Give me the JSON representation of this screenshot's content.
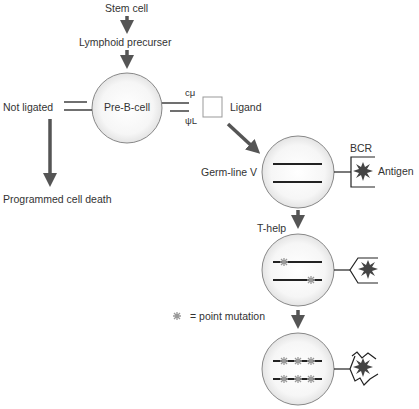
{
  "labels": {
    "stem_cell": "Stem cell",
    "lymphoid_precursor": "Lymphoid precurser",
    "pre_b_cell": "Pre-B-cell",
    "not_ligated": "Not ligated",
    "programmed_cell_death": "Programmed cell death",
    "c_mu": "cμ",
    "psi_l": "ψL",
    "ligand": "Ligand",
    "germ_line_v": "Germ-line V",
    "bcr": "BCR",
    "antigen": "Antigen",
    "t_help": "T-help",
    "legend_symbol": "✻",
    "legend_text": "= point mutation"
  },
  "colors": {
    "arrow": "#555555",
    "line": "#222222",
    "cell_fill": "#f0f0f0",
    "cell_stroke": "#888888",
    "antigen": "#444444",
    "mutation": "#999999"
  },
  "stages": [
    {
      "name": "pre-b-cell",
      "mutations_per_line": 0
    },
    {
      "name": "germ-line-v",
      "mutations_per_line": 0
    },
    {
      "name": "t-help-cell",
      "mutations_per_line": 1
    },
    {
      "name": "hypermutated-cell",
      "mutations_per_line": 3
    }
  ]
}
